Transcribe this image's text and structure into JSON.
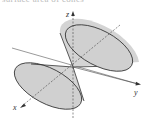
{
  "caption": "surface area of cones",
  "figure": {
    "type": "double elliptic cone",
    "axes": {
      "x_label": "x",
      "y_label": "y",
      "z_label": "z"
    },
    "colors": {
      "surface_fill": "#d4d4d4",
      "outline": "#333333",
      "axis": "#444444"
    }
  }
}
